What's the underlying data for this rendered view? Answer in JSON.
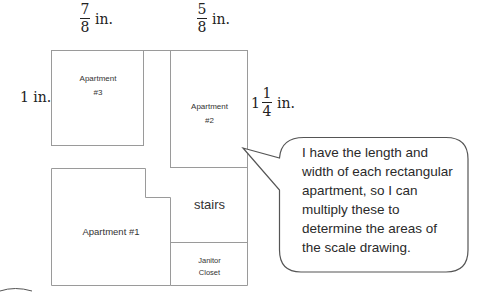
{
  "diagram": {
    "dimensions": {
      "apt3_width": {
        "numerator": "7",
        "denominator": "8",
        "unit": "in."
      },
      "apt2_width": {
        "numerator": "5",
        "denominator": "8",
        "unit": "in."
      },
      "apt3_height": {
        "value": "1 in."
      },
      "apt2_height": {
        "whole": "1",
        "numerator": "1",
        "denominator": "4",
        "unit": "in."
      }
    },
    "rooms": {
      "apt3": {
        "line1": "Apartment",
        "line2": "#3"
      },
      "apt2": {
        "line1": "Apartment",
        "line2": "#2"
      },
      "apt1": {
        "label": "Apartment #1"
      },
      "stairs": {
        "label": "stairs"
      },
      "janitor": {
        "line1": "Janitor",
        "line2": "Closet"
      }
    },
    "callout": {
      "lines": [
        "I have the length and",
        "width of each rectangular",
        "apartment, so I can",
        "multiply these to",
        "determine the areas of",
        "the scale drawing."
      ]
    },
    "colors": {
      "wall": "#9a9a9a",
      "bubble_border": "#555555",
      "text": "#222222"
    }
  }
}
